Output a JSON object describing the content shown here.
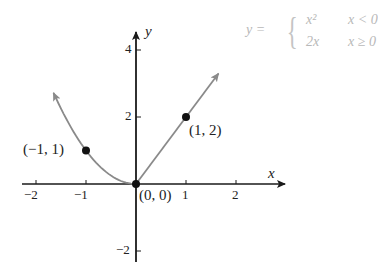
{
  "chart_data": {
    "type": "line",
    "title": "",
    "xlabel": "x",
    "ylabel": "y",
    "xlim": [
      -2.3,
      2.9
    ],
    "ylim": [
      -2.4,
      4.6
    ],
    "grid": false,
    "x_ticks": [
      -2,
      -1,
      1,
      2
    ],
    "x_tick_labels": [
      "−2",
      "−1",
      "1",
      "2"
    ],
    "y_ticks": [
      -2,
      2,
      4
    ],
    "y_tick_labels": [
      "−2",
      "2",
      "4"
    ],
    "function": {
      "name": "y",
      "pieces": [
        {
          "expr": "x²",
          "condition": "x < 0"
        },
        {
          "expr": "2x",
          "condition": "x ≥ 0"
        }
      ]
    },
    "series": [
      {
        "name": "y = x² (x < 0)",
        "x": [
          -1.7,
          -1.5,
          -1.25,
          -1,
          -0.75,
          -0.5,
          -0.25,
          0
        ],
        "y": [
          2.89,
          2.25,
          1.5625,
          1,
          0.5625,
          0.25,
          0.0625,
          0
        ],
        "arrow_end": "left"
      },
      {
        "name": "y = 2x (x ≥ 0)",
        "x": [
          0,
          1,
          1.65
        ],
        "y": [
          0,
          2,
          3.3
        ],
        "arrow_end": "right"
      }
    ],
    "points": [
      {
        "x": -1,
        "y": 1,
        "label": "(−1, 1)"
      },
      {
        "x": 0,
        "y": 0,
        "label": "(0, 0)"
      },
      {
        "x": 1,
        "y": 2,
        "label": "(1, 2)"
      }
    ]
  },
  "labels": {
    "x_axis": "x",
    "y_axis": "y",
    "formula_lhs": "y =",
    "formula_row1_expr": "x²",
    "formula_row1_cond": "x < 0",
    "formula_row2_expr": "2x",
    "formula_row2_cond": "x ≥ 0",
    "brace": "{"
  },
  "colors": {
    "axis": "#1a1a1a",
    "curve": "#8a8a8a",
    "point": "#111111",
    "formula": "#b8b8b8"
  }
}
